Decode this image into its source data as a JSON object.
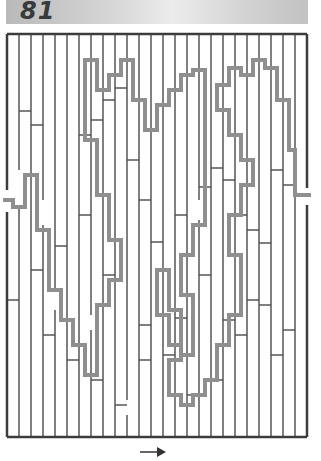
{
  "puzzle": {
    "number": "81",
    "direction_arrow": "→"
  },
  "colors": {
    "wall": "#4a4a4a",
    "path": "#8f8f8f",
    "frame": "#3c3c3c"
  },
  "maze": {
    "frame": {
      "x": 7,
      "y": 34,
      "w": 300,
      "h": 403
    },
    "verticals": [
      {
        "x": 19,
        "segs": [
          [
            34,
            170
          ],
          [
            205,
            437
          ]
        ]
      },
      {
        "x": 31,
        "segs": [
          [
            34,
            437
          ]
        ]
      },
      {
        "x": 43,
        "segs": [
          [
            34,
            200
          ],
          [
            225,
            437
          ]
        ]
      },
      {
        "x": 55,
        "segs": [
          [
            34,
            290
          ],
          [
            310,
            437
          ]
        ]
      },
      {
        "x": 67,
        "segs": [
          [
            34,
            437
          ]
        ]
      },
      {
        "x": 79,
        "segs": [
          [
            34,
            437
          ]
        ]
      },
      {
        "x": 91,
        "segs": [
          [
            34,
            315
          ],
          [
            330,
            437
          ]
        ]
      },
      {
        "x": 103,
        "segs": [
          [
            34,
            437
          ]
        ]
      },
      {
        "x": 115,
        "segs": [
          [
            34,
            437
          ]
        ]
      },
      {
        "x": 127,
        "segs": [
          [
            34,
            400
          ],
          [
            415,
            437
          ]
        ]
      },
      {
        "x": 139,
        "segs": [
          [
            34,
            437
          ]
        ]
      },
      {
        "x": 151,
        "segs": [
          [
            34,
            437
          ]
        ]
      },
      {
        "x": 163,
        "segs": [
          [
            34,
            437
          ]
        ]
      },
      {
        "x": 175,
        "segs": [
          [
            34,
            437
          ]
        ]
      },
      {
        "x": 187,
        "segs": [
          [
            34,
            437
          ]
        ]
      },
      {
        "x": 199,
        "segs": [
          [
            34,
            200
          ],
          [
            220,
            437
          ]
        ]
      },
      {
        "x": 211,
        "segs": [
          [
            34,
            437
          ]
        ]
      },
      {
        "x": 223,
        "segs": [
          [
            34,
            437
          ]
        ]
      },
      {
        "x": 235,
        "segs": [
          [
            34,
            437
          ]
        ]
      },
      {
        "x": 247,
        "segs": [
          [
            34,
            437
          ]
        ]
      },
      {
        "x": 259,
        "segs": [
          [
            34,
            437
          ]
        ]
      },
      {
        "x": 271,
        "segs": [
          [
            34,
            437
          ]
        ]
      },
      {
        "x": 283,
        "segs": [
          [
            34,
            437
          ]
        ]
      },
      {
        "x": 295,
        "segs": [
          [
            34,
            437
          ]
        ]
      }
    ],
    "horizontals": [
      [
        19,
        31,
        111
      ],
      [
        31,
        43,
        125
      ],
      [
        79,
        91,
        135
      ],
      [
        91,
        103,
        120
      ],
      [
        103,
        115,
        100
      ],
      [
        115,
        127,
        88
      ],
      [
        127,
        139,
        160
      ],
      [
        139,
        151,
        200
      ],
      [
        151,
        163,
        242
      ],
      [
        175,
        187,
        215
      ],
      [
        199,
        211,
        187
      ],
      [
        211,
        223,
        168
      ],
      [
        223,
        235,
        180
      ],
      [
        235,
        247,
        215
      ],
      [
        247,
        259,
        230
      ],
      [
        259,
        271,
        243
      ],
      [
        283,
        295,
        185
      ],
      [
        271,
        283,
        170
      ],
      [
        31,
        43,
        270
      ],
      [
        55,
        67,
        246
      ],
      [
        79,
        91,
        215
      ],
      [
        103,
        115,
        275
      ],
      [
        139,
        151,
        325
      ],
      [
        175,
        187,
        318
      ],
      [
        199,
        211,
        275
      ],
      [
        223,
        235,
        320
      ],
      [
        247,
        259,
        300
      ],
      [
        271,
        283,
        355
      ],
      [
        283,
        295,
        330
      ],
      [
        7,
        19,
        300
      ],
      [
        43,
        55,
        335
      ],
      [
        67,
        79,
        360
      ],
      [
        91,
        103,
        380
      ],
      [
        115,
        127,
        405
      ],
      [
        139,
        151,
        360
      ],
      [
        163,
        175,
        355
      ],
      [
        187,
        199,
        395
      ],
      [
        211,
        223,
        380
      ],
      [
        235,
        247,
        335
      ],
      [
        259,
        271,
        305
      ]
    ],
    "solution_path": [
      [
        3,
        200
      ],
      [
        13,
        200
      ],
      [
        13,
        207
      ],
      [
        25,
        207
      ],
      [
        25,
        175
      ],
      [
        37,
        175
      ],
      [
        37,
        230
      ],
      [
        49,
        230
      ],
      [
        49,
        290
      ],
      [
        61,
        290
      ],
      [
        61,
        320
      ],
      [
        73,
        320
      ],
      [
        73,
        345
      ],
      [
        85,
        345
      ],
      [
        85,
        375
      ],
      [
        97,
        375
      ],
      [
        97,
        305
      ],
      [
        109,
        305
      ],
      [
        109,
        280
      ],
      [
        121,
        280
      ],
      [
        121,
        240
      ],
      [
        109,
        240
      ],
      [
        109,
        195
      ],
      [
        97,
        195
      ],
      [
        97,
        140
      ],
      [
        85,
        140
      ],
      [
        85,
        60
      ],
      [
        97,
        60
      ],
      [
        97,
        90
      ],
      [
        109,
        90
      ],
      [
        109,
        75
      ],
      [
        121,
        75
      ],
      [
        121,
        60
      ],
      [
        133,
        60
      ],
      [
        133,
        100
      ],
      [
        145,
        100
      ],
      [
        145,
        130
      ],
      [
        157,
        130
      ],
      [
        157,
        105
      ],
      [
        169,
        105
      ],
      [
        169,
        90
      ],
      [
        181,
        90
      ],
      [
        181,
        75
      ],
      [
        193,
        75
      ],
      [
        193,
        70
      ],
      [
        205,
        70
      ],
      [
        205,
        225
      ],
      [
        193,
        225
      ],
      [
        193,
        255
      ],
      [
        181,
        255
      ],
      [
        181,
        295
      ],
      [
        193,
        295
      ],
      [
        193,
        355
      ],
      [
        181,
        355
      ],
      [
        181,
        345
      ],
      [
        169,
        345
      ],
      [
        169,
        315
      ],
      [
        157,
        315
      ],
      [
        157,
        270
      ],
      [
        169,
        270
      ],
      [
        169,
        310
      ],
      [
        181,
        310
      ],
      [
        181,
        360
      ],
      [
        169,
        360
      ],
      [
        169,
        395
      ],
      [
        181,
        395
      ],
      [
        181,
        405
      ],
      [
        193,
        405
      ],
      [
        193,
        395
      ],
      [
        205,
        395
      ],
      [
        205,
        380
      ],
      [
        217,
        380
      ],
      [
        217,
        345
      ],
      [
        229,
        345
      ],
      [
        229,
        315
      ],
      [
        241,
        315
      ],
      [
        241,
        255
      ],
      [
        229,
        255
      ],
      [
        229,
        215
      ],
      [
        241,
        215
      ],
      [
        241,
        185
      ],
      [
        253,
        185
      ],
      [
        253,
        160
      ],
      [
        241,
        160
      ],
      [
        241,
        135
      ],
      [
        229,
        135
      ],
      [
        229,
        110
      ],
      [
        217,
        110
      ],
      [
        217,
        85
      ],
      [
        229,
        85
      ],
      [
        229,
        68
      ],
      [
        241,
        68
      ],
      [
        241,
        75
      ],
      [
        253,
        75
      ],
      [
        253,
        60
      ],
      [
        265,
        60
      ],
      [
        265,
        68
      ],
      [
        277,
        68
      ],
      [
        277,
        100
      ],
      [
        289,
        100
      ],
      [
        289,
        150
      ],
      [
        295,
        150
      ],
      [
        295,
        195
      ],
      [
        311,
        195
      ]
    ],
    "arrow": {
      "x1": 140,
      "y1": 452,
      "x2": 166,
      "y2": 452
    }
  }
}
